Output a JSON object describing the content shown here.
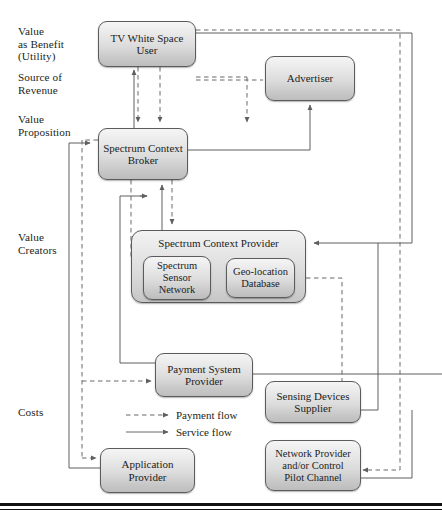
{
  "figure": {
    "kind": "business-model-value-network-diagram",
    "background": "#ffffff",
    "node_border": "#5b5b5b",
    "flow_color": "#5f5f5f",
    "rule_color": "#111111"
  },
  "axis_labels": [
    {
      "id": "value-as-benefit",
      "text": "Value\nas Benefit\n(Utility)",
      "x": 18,
      "y": 26
    },
    {
      "id": "source-of-revenue",
      "text": "Source of\nRevenue",
      "x": 18,
      "y": 72
    },
    {
      "id": "value-proposition",
      "text": "Value\nProposition",
      "x": 18,
      "y": 114
    },
    {
      "id": "value-creators",
      "text": "Value\nCreators",
      "x": 18,
      "y": 232
    },
    {
      "id": "costs",
      "text": "Costs",
      "x": 18,
      "y": 406
    }
  ],
  "nodes": [
    {
      "id": "tv-white-space-user",
      "label": "TV White Space\nUser",
      "x": 98,
      "y": 21,
      "w": 98,
      "h": 46
    },
    {
      "id": "advertiser",
      "label": "Advertiser",
      "x": 265,
      "y": 56,
      "w": 90,
      "h": 45
    },
    {
      "id": "spectrum-context-broker",
      "label": "Spectrum Context\nBroker",
      "x": 98,
      "y": 128,
      "w": 90,
      "h": 52
    },
    {
      "id": "spectrum-context-provider",
      "label": "Spectrum Context Provider",
      "x": 131,
      "y": 230,
      "w": 175,
      "h": 73,
      "group": true
    },
    {
      "id": "spectrum-sensor-network",
      "label": "Spectrum\nSensor\nNetwork",
      "x": 143,
      "y": 256,
      "w": 68,
      "h": 44
    },
    {
      "id": "geo-location-database",
      "label": "Geo-location\nDatabase",
      "x": 226,
      "y": 258,
      "w": 69,
      "h": 40
    },
    {
      "id": "payment-system-provider",
      "label": "Payment System\nProvider",
      "x": 155,
      "y": 353,
      "w": 98,
      "h": 44
    },
    {
      "id": "sensing-devices-supplier",
      "label": "Sensing Devices\nSupplier",
      "x": 265,
      "y": 381,
      "w": 96,
      "h": 42
    },
    {
      "id": "application-provider",
      "label": "Application\nProvider",
      "x": 100,
      "y": 448,
      "w": 95,
      "h": 45
    },
    {
      "id": "network-provider",
      "label": "Network Provider\nand/or Control\nPilot Channel",
      "x": 265,
      "y": 440,
      "w": 96,
      "h": 51
    }
  ],
  "legend": {
    "items": [
      {
        "id": "payment-flow",
        "label": "Payment flow",
        "style": "dashed",
        "x": 126,
        "y": 415,
        "line_w": 44,
        "text_x": 176
      },
      {
        "id": "service-flow",
        "label": "Service flow",
        "style": "solid",
        "x": 126,
        "y": 432,
        "line_w": 44,
        "text_x": 176
      }
    ]
  },
  "rules": [
    {
      "id": "cost-divider",
      "y": 374,
      "thickness": 1,
      "color": "#4a4a4a",
      "x": 0,
      "w": 442
    },
    {
      "id": "bottom-rule-1",
      "y": 503,
      "thickness": 2.5,
      "color": "#111111",
      "x": 0,
      "w": 442
    },
    {
      "id": "bottom-rule-2",
      "y": 508,
      "thickness": 1,
      "color": "#111111",
      "x": 0,
      "w": 442
    }
  ],
  "flows": {
    "service": [
      {
        "id": "broker-to-user",
        "d": "M136,128 L136,72"
      },
      {
        "id": "broker-to-advertiser",
        "d": "M188,150 L310,150 L310,104"
      },
      {
        "id": "provider-to-broker",
        "d": "M160,230 L160,200 L160,183"
      },
      {
        "id": "payment-to-broker",
        "d": "M160,353 L160,200 L160,183"
      },
      {
        "id": "left-rail-to-broker",
        "d": "M69,465 L69,145 L94,145"
      },
      {
        "id": "right-rail-to-provider",
        "d": "M412,21 L412,245 L310,245"
      },
      {
        "id": "provider-right-stub",
        "d": "M306,245 L412,245"
      },
      {
        "id": "payment-right-rail",
        "d": "M253,374 L442,374"
      },
      {
        "id": "sensing-to-rail",
        "d": "M361,402 L376,402 L376,245"
      },
      {
        "id": "network-to-rail",
        "d": "M361,480 L412,480 L412,400"
      },
      {
        "id": "app-to-left-rail",
        "d": "M100,470 L69,470"
      },
      {
        "id": "payment-in-left",
        "d": "M155,368 L120,368 L120,340"
      }
    ],
    "payment": [
      {
        "id": "user-to-advertiser",
        "d": "M196,80 L265,80"
      },
      {
        "id": "user-down-a",
        "d": "M136,67 L136,126"
      },
      {
        "id": "user-down-b",
        "d": "M160,67 L160,126"
      },
      {
        "id": "advertiser-down",
        "d": "M250,95 L250,126"
      },
      {
        "id": "broker-to-provider",
        "d": "M170,180 L170,228"
      },
      {
        "id": "broker-down-left",
        "d": "M131,180 L131,250"
      },
      {
        "id": "left-dashed-rail",
        "d": "M82,140 L82,455"
      },
      {
        "id": "dashed-to-payment",
        "d": "M82,380 L153,380"
      },
      {
        "id": "dashed-to-app",
        "d": "M82,458 L98,458"
      },
      {
        "id": "geo-to-right-dashed",
        "d": "M295,278 L340,278 L340,400"
      },
      {
        "id": "right-dashed-rail",
        "d": "M400,30 L400,473"
      },
      {
        "id": "dashed-to-network",
        "d": "M400,466 L363,466"
      },
      {
        "id": "dashed-to-sensing",
        "d": "M340,400 L363,400"
      }
    ]
  }
}
